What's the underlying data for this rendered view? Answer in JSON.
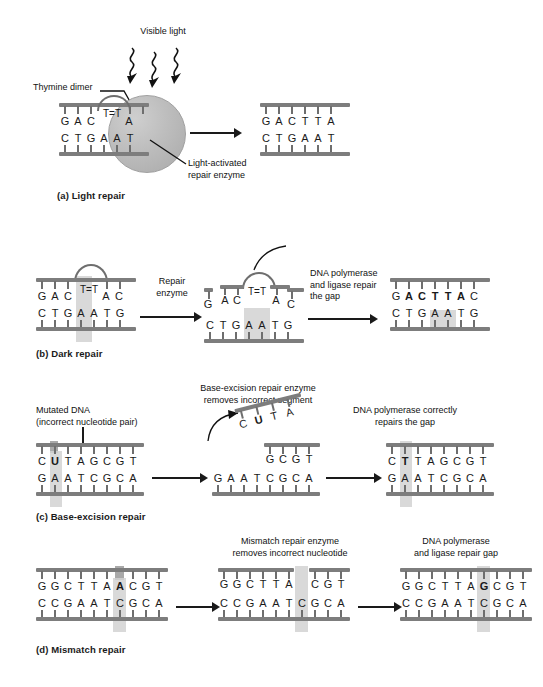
{
  "figure": {
    "panels": [
      {
        "id": "a",
        "caption": "(a) Light repair",
        "labels": {
          "light": "Visible light",
          "dimer": "Thymine dimer",
          "enzyme": "Light-activated\nrepair enzyme"
        },
        "steps": [
          {
            "name": "damaged",
            "top_seq": "G A C T=T A",
            "bottom_seq": "C T G A A T",
            "top_bases": [
              "G",
              "A",
              "C",
              "T",
              "=",
              "T",
              "A"
            ],
            "bottom_bases": [
              "C",
              "T",
              "G",
              "A",
              "A",
              "T"
            ],
            "has_dimer": true,
            "has_enzyme": true
          },
          {
            "name": "repaired",
            "top_bases": [
              "G",
              "A",
              "C",
              "T",
              "T",
              "A"
            ],
            "bottom_bases": [
              "C",
              "T",
              "G",
              "A",
              "A",
              "T"
            ],
            "has_dimer": false,
            "has_enzyme": false
          }
        ]
      },
      {
        "id": "b",
        "caption": "(b) Dark repair",
        "labels": {
          "step1": "Repair\nenzyme",
          "step2": "DNA polymerase\nand ligase repair\nthe gap"
        },
        "steps": [
          {
            "name": "damaged",
            "top_bases": [
              "G",
              "A",
              "C",
              "T",
              "=",
              "T",
              "A",
              "C"
            ],
            "bottom_bases": [
              "C",
              "T",
              "G",
              "A",
              "A",
              "T",
              "G"
            ]
          },
          {
            "name": "excised",
            "top_remaining_left": [
              "G"
            ],
            "top_fragment": [
              "A",
              "C",
              "T",
              "=",
              "T",
              "A"
            ],
            "top_remaining_right": [
              "C"
            ],
            "bottom_bases": [
              "C",
              "T",
              "G",
              "A",
              "A",
              "T",
              "G"
            ]
          },
          {
            "name": "repaired",
            "top_bases": [
              "G",
              "A",
              "C",
              "T",
              "T",
              "A",
              "C"
            ],
            "top_bold": [
              "A",
              "C",
              "T",
              "T",
              "A"
            ],
            "bottom_bases": [
              "C",
              "T",
              "G",
              "A",
              "A",
              "T",
              "G"
            ]
          }
        ]
      },
      {
        "id": "c",
        "caption": "(c) Base-excision repair",
        "labels": {
          "mutated": "Mutated DNA\n(incorrect nucleotide pair)",
          "step1": "Base-excision repair enzyme\nremoves incorrect segment",
          "step2": "DNA polymerase correctly\nrepairs the gap"
        },
        "steps": [
          {
            "name": "mutated",
            "top_bases": [
              "C",
              "U",
              "T",
              "A",
              "G",
              "C",
              "G",
              "T"
            ],
            "top_bold_index": 1,
            "bottom_bases": [
              "G",
              "A",
              "A",
              "T",
              "C",
              "G",
              "C",
              "A"
            ]
          },
          {
            "name": "excised",
            "fragment_bases": [
              "C",
              "U",
              "T",
              "A"
            ],
            "fragment_bold_index": 1,
            "top_bases": [
              "G",
              "C",
              "G",
              "T"
            ],
            "bottom_bases": [
              "G",
              "A",
              "A",
              "T",
              "C",
              "G",
              "C",
              "A"
            ]
          },
          {
            "name": "repaired",
            "top_bases": [
              "C",
              "T",
              "T",
              "A",
              "G",
              "C",
              "G",
              "T"
            ],
            "top_bold_index": 1,
            "bottom_bases": [
              "G",
              "A",
              "A",
              "T",
              "C",
              "G",
              "C",
              "A"
            ]
          }
        ]
      },
      {
        "id": "d",
        "caption": "(d) Mismatch repair",
        "labels": {
          "step1": "Mismatch repair enzyme\nremoves incorrect nucleotide",
          "step2": "DNA polymerase\nand ligase repair gap"
        },
        "steps": [
          {
            "name": "mismatch",
            "top_bases": [
              "G",
              "G",
              "C",
              "T",
              "T",
              "A",
              "A",
              "C",
              "G",
              "T"
            ],
            "top_bold_index": 6,
            "bottom_bases": [
              "C",
              "C",
              "G",
              "A",
              "A",
              "T",
              "C",
              "G",
              "C",
              "A"
            ]
          },
          {
            "name": "removed",
            "top_left_bases": [
              "G",
              "G",
              "C",
              "T",
              "T",
              "A"
            ],
            "top_right_bases": [
              "C",
              "G",
              "T"
            ],
            "bottom_bases": [
              "C",
              "C",
              "G",
              "A",
              "A",
              "T",
              "C",
              "G",
              "C",
              "A"
            ]
          },
          {
            "name": "repaired",
            "top_bases": [
              "G",
              "G",
              "C",
              "T",
              "T",
              "A",
              "G",
              "C",
              "G",
              "T"
            ],
            "top_bold_index": 6,
            "bottom_bases": [
              "C",
              "C",
              "G",
              "A",
              "A",
              "T",
              "C",
              "G",
              "C",
              "A"
            ]
          }
        ]
      }
    ],
    "colors": {
      "backbone": "#7d7d7d",
      "tick": "#6e6e6e",
      "highlight": "#d2d2d2",
      "highlight_dark": "#9a9a9a",
      "enzyme": "#bdbdbd",
      "text": "#1a1a1a"
    }
  }
}
